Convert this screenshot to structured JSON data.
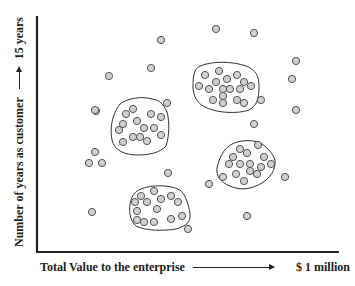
{
  "axes": {
    "y_label": "Number of years as customer",
    "y_end_label": "15 years",
    "x_label": "Total Value to the enterprise",
    "x_end_label": "$ 1 million"
  },
  "style": {
    "dot_fill": "#d0d0d0",
    "dot_stroke": "#555555",
    "line_color": "#222222"
  },
  "chart_data": {
    "type": "scatter",
    "title": "",
    "xlabel": "Total Value to the enterprise → $ 1 million",
    "ylabel": "Number of years as customer → 15 years",
    "grid": false,
    "clusters": [
      {
        "name": "cluster-left-middle",
        "encircled": true
      },
      {
        "name": "cluster-top-right",
        "encircled": true
      },
      {
        "name": "cluster-right-lower",
        "encircled": true
      },
      {
        "name": "cluster-bottom-left",
        "encircled": true
      }
    ],
    "points_px": [
      [
        126,
        114
      ],
      [
        133,
        109
      ],
      [
        151,
        114
      ],
      [
        161,
        117
      ],
      [
        137,
        121
      ],
      [
        123,
        124
      ],
      [
        144,
        128
      ],
      [
        154,
        128
      ],
      [
        119,
        130
      ],
      [
        161,
        135
      ],
      [
        133,
        137
      ],
      [
        140,
        137
      ],
      [
        147,
        141
      ],
      [
        123,
        142
      ],
      [
        205,
        75
      ],
      [
        219,
        71
      ],
      [
        237,
        75
      ],
      [
        216,
        82
      ],
      [
        227,
        79
      ],
      [
        244,
        82
      ],
      [
        199,
        86
      ],
      [
        251,
        86
      ],
      [
        209,
        89
      ],
      [
        223,
        89
      ],
      [
        230,
        89
      ],
      [
        240,
        89
      ],
      [
        223,
        96
      ],
      [
        213,
        100
      ],
      [
        237,
        100
      ],
      [
        223,
        103
      ],
      [
        244,
        103
      ],
      [
        258,
        145
      ],
      [
        240,
        149
      ],
      [
        247,
        153
      ],
      [
        233,
        157
      ],
      [
        264,
        157
      ],
      [
        229,
        164
      ],
      [
        240,
        164
      ],
      [
        250,
        164
      ],
      [
        271,
        164
      ],
      [
        261,
        167
      ],
      [
        250,
        171
      ],
      [
        257,
        174
      ],
      [
        236,
        174
      ],
      [
        223,
        177
      ],
      [
        244,
        181
      ],
      [
        141,
        196
      ],
      [
        154,
        191
      ],
      [
        171,
        196
      ],
      [
        135,
        202
      ],
      [
        147,
        202
      ],
      [
        161,
        199
      ],
      [
        178,
        202
      ],
      [
        137,
        211
      ],
      [
        157,
        209
      ],
      [
        182,
        216
      ],
      [
        171,
        219
      ],
      [
        144,
        222
      ],
      [
        154,
        222
      ],
      [
        137,
        220
      ],
      [
        167,
        103
      ],
      [
        96,
        111
      ],
      [
        261,
        100
      ],
      [
        216,
        29
      ],
      [
        254,
        33
      ],
      [
        296,
        61
      ],
      [
        292,
        79
      ],
      [
        296,
        110
      ],
      [
        254,
        124
      ],
      [
        285,
        177
      ],
      [
        209,
        184
      ],
      [
        254,
        124
      ],
      [
        168,
        173
      ],
      [
        247,
        216
      ],
      [
        188,
        229
      ],
      [
        109,
        76
      ],
      [
        95,
        110
      ],
      [
        95,
        152
      ],
      [
        89,
        163
      ],
      [
        102,
        163
      ],
      [
        92,
        212
      ],
      [
        161,
        40
      ],
      [
        151,
        68
      ]
    ]
  }
}
